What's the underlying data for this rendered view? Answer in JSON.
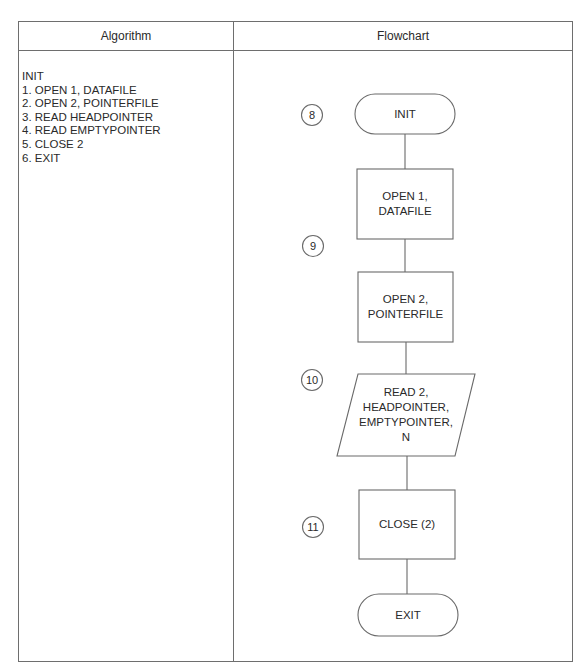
{
  "table": {
    "headers": {
      "algorithm": "Algorithm",
      "flowchart": "Flowchart"
    }
  },
  "algorithm": {
    "lines": [
      "INIT",
      "1. OPEN 1, DATAFILE",
      "2. OPEN 2, POINTERFILE",
      "3. READ HEADPOINTER",
      "4. READ EMPTYPOINTER",
      "5. CLOSE  2",
      "6. EXIT"
    ]
  },
  "flowchart": {
    "nodes": [
      {
        "id": "init",
        "type": "terminal",
        "lines": [
          "INIT"
        ],
        "step": "8"
      },
      {
        "id": "open1",
        "type": "process",
        "lines": [
          "OPEN 1,",
          "DATAFILE"
        ],
        "step": "9"
      },
      {
        "id": "open2",
        "type": "process",
        "lines": [
          "OPEN 2,",
          "POINTERFILE"
        ]
      },
      {
        "id": "read2",
        "type": "input-output",
        "lines": [
          "READ 2,",
          "HEADPOINTER,",
          "EMPTYPOINTER,",
          "N"
        ],
        "step": "10"
      },
      {
        "id": "close2",
        "type": "process",
        "lines": [
          "CLOSE (2)"
        ],
        "step": "11"
      },
      {
        "id": "exit",
        "type": "terminal",
        "lines": [
          "EXIT"
        ]
      }
    ],
    "edges": [
      [
        "init",
        "open1"
      ],
      [
        "open1",
        "open2"
      ],
      [
        "open2",
        "read2"
      ],
      [
        "read2",
        "close2"
      ],
      [
        "close2",
        "exit"
      ]
    ]
  }
}
